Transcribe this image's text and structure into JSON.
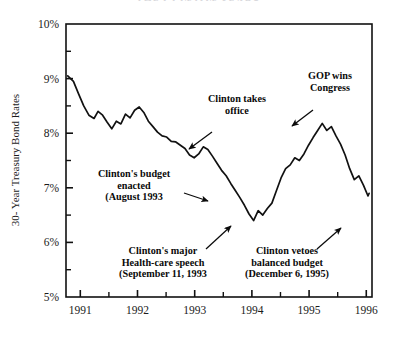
{
  "figure": {
    "title_clipped": "THE CLINTON YEARS",
    "background": "#ffffff",
    "line_color": "#111111",
    "axis_color": "#111111"
  },
  "axes": {
    "y_title": "30- Year Treasury Bond Rates",
    "y_ticks": [
      "10%",
      "9%",
      "8%",
      "7%",
      "6%",
      "5%"
    ],
    "y_tick_values": [
      10,
      9,
      8,
      7,
      6,
      5
    ],
    "y_minor_values": [
      9.5,
      8.5,
      7.5,
      6.5,
      5.5
    ],
    "x_ticks": [
      "1991",
      "1992",
      "1993",
      "1994",
      "1995",
      "1996"
    ],
    "x_tick_values": [
      1991,
      1992,
      1993,
      1994,
      1995,
      1996
    ],
    "x_minor_values": [
      1991.5,
      1992.5,
      1993.5,
      1994.5,
      1995.5
    ]
  },
  "annotations": [
    {
      "id": "clinton-takes-office",
      "lines": [
        "Clinton takes",
        "office"
      ],
      "text_x": 237,
      "text_y": 102,
      "arrow": {
        "x1": 212,
        "y1": 132,
        "x2": 189,
        "y2": 149
      }
    },
    {
      "id": "gop-wins-congress",
      "lines": [
        "GOP wins",
        "Congress"
      ],
      "text_x": 330,
      "text_y": 79,
      "arrow": {
        "x1": 313,
        "y1": 110,
        "x2": 292,
        "y2": 126
      }
    },
    {
      "id": "clintons-budget-enacted",
      "lines": [
        "Clinton's budget",
        "enacted",
        "(August 1993"
      ],
      "text_x": 134,
      "text_y": 177,
      "arrow": {
        "x1": 184,
        "y1": 193,
        "x2": 208,
        "y2": 201
      }
    },
    {
      "id": "clintons-health-care-speech",
      "lines": [
        "Clinton's major",
        "Health-care speech",
        "(September 11, 1993"
      ],
      "text_x": 163,
      "text_y": 254,
      "arrow": {
        "x1": 206,
        "y1": 249,
        "x2": 231,
        "y2": 226
      }
    },
    {
      "id": "clinton-vetoes-balanced-budget",
      "lines": [
        "Clinton vetoes",
        "balanced budget",
        "(December 6, 1995)"
      ],
      "text_x": 287,
      "text_y": 254,
      "arrow": {
        "x1": 317,
        "y1": 249,
        "x2": 341,
        "y2": 228
      }
    }
  ],
  "chart_data": {
    "type": "line",
    "title": "THE CLINTON YEARS",
    "xlabel": "",
    "ylabel": "30- Year Treasury Bond Rates",
    "xlim": [
      1990.75,
      1996.1
    ],
    "ylim": [
      5,
      10
    ],
    "grid": false,
    "legend": "none",
    "series": [
      {
        "name": "30-Year Treasury Bond Rate",
        "x": [
          1990.78,
          1990.88,
          1990.97,
          1991.06,
          1991.15,
          1991.24,
          1991.31,
          1991.39,
          1991.47,
          1991.55,
          1991.63,
          1991.71,
          1991.79,
          1991.87,
          1991.95,
          1992.03,
          1992.11,
          1992.19,
          1992.27,
          1992.35,
          1992.43,
          1992.51,
          1992.59,
          1992.67,
          1992.75,
          1992.83,
          1992.91,
          1992.99,
          1993.07,
          1993.15,
          1993.23,
          1993.31,
          1993.39,
          1993.47,
          1993.55,
          1993.63,
          1993.71,
          1993.79,
          1993.87,
          1993.95,
          1994.03,
          1994.11,
          1994.19,
          1994.27,
          1994.35,
          1994.43,
          1994.51,
          1994.59,
          1994.67,
          1994.75,
          1994.83,
          1994.91,
          1994.99,
          1995.07,
          1995.15,
          1995.23,
          1995.31,
          1995.39,
          1995.47,
          1995.55,
          1995.63,
          1995.71,
          1995.79,
          1995.87,
          1995.95,
          1996.03
        ],
        "y": [
          9.05,
          8.95,
          8.72,
          8.5,
          8.33,
          8.27,
          8.4,
          8.33,
          8.2,
          8.08,
          8.22,
          8.17,
          8.35,
          8.28,
          8.42,
          8.48,
          8.38,
          8.22,
          8.12,
          8.02,
          7.95,
          7.93,
          7.85,
          7.84,
          7.78,
          7.72,
          7.6,
          7.55,
          7.62,
          7.75,
          7.7,
          7.58,
          7.45,
          7.32,
          7.22,
          7.08,
          6.95,
          6.82,
          6.68,
          6.52,
          6.4,
          6.58,
          6.5,
          6.62,
          6.72,
          6.95,
          7.18,
          7.35,
          7.42,
          7.55,
          7.5,
          7.62,
          7.78,
          7.92,
          8.05,
          8.18,
          8.05,
          8.12,
          7.95,
          7.8,
          7.6,
          7.35,
          7.15,
          7.22,
          7.05,
          6.85
        ],
        "tail_x": [
          1996.03,
          1996.05
        ],
        "tail_y": [
          6.85,
          6.9
        ]
      }
    ],
    "key_points": {
      "start_1990_late": 9.05,
      "local_peak_1992_early": 8.48,
      "trough_1993_oct": 6.4,
      "peak_1994_nov": 8.18,
      "trough_1995_dec": 6.32,
      "end_1996": 7.22
    }
  }
}
